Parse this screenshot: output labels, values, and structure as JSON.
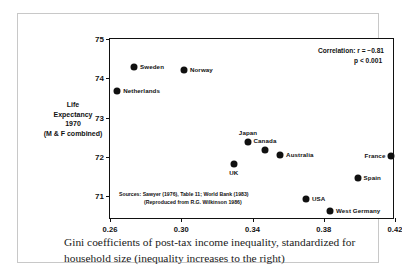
{
  "chart_data": {
    "type": "scatter",
    "title": "",
    "caption": "Gini coefficients of post-tax income inequality, standardized for household size (inequality increases to the right)",
    "xlabel": "",
    "ylabel": "Life Expectancy 1970 (M & F combined)",
    "ylabel_lines": [
      "Life",
      "Expectancy",
      "1970",
      "(M & F combined)"
    ],
    "xlim": [
      0.26,
      0.42
    ],
    "ylim": [
      70.4,
      75.0
    ],
    "xticks": [
      "0.26",
      "0.30",
      "0.34",
      "0.38",
      "0.42"
    ],
    "xtick_values": [
      0.26,
      0.3,
      0.34,
      0.38,
      0.42
    ],
    "yticks": [
      "71",
      "72",
      "73",
      "74",
      "75"
    ],
    "ytick_values": [
      71,
      72,
      73,
      74,
      75
    ],
    "grid": false,
    "legend": "none",
    "marker_color": "#101010",
    "axis_color": "#111111",
    "points": [
      {
        "label": "Sweden",
        "x": 0.2735,
        "y": 74.3,
        "label_pos": "right"
      },
      {
        "label": "Norway",
        "x": 0.3015,
        "y": 74.2,
        "label_pos": "right"
      },
      {
        "label": "Netherlands",
        "x": 0.264,
        "y": 73.68,
        "label_pos": "right"
      },
      {
        "label": "Japan",
        "x": 0.3375,
        "y": 72.38,
        "label_pos": "above"
      },
      {
        "label": "Canada",
        "x": 0.347,
        "y": 72.18,
        "label_pos": "above"
      },
      {
        "label": "Australia",
        "x": 0.3555,
        "y": 72.05,
        "label_pos": "right"
      },
      {
        "label": "France",
        "x": 0.418,
        "y": 72.03,
        "label_pos": "left"
      },
      {
        "label": "UK",
        "x": 0.3295,
        "y": 71.83,
        "label_pos": "below"
      },
      {
        "label": "Spain",
        "x": 0.399,
        "y": 71.47,
        "label_pos": "right"
      },
      {
        "label": "USA",
        "x": 0.37,
        "y": 70.93,
        "label_pos": "right"
      },
      {
        "label": "West Germany",
        "x": 0.3835,
        "y": 70.62,
        "label_pos": "right"
      }
    ],
    "annotations": {
      "correlation_line1": "Correlation:  r = −0.81",
      "correlation_line2": "p < 0.001",
      "sources_line1": "Sources:  Sawyer (1976), Table 11; World Bank (1983)",
      "sources_line2": "(Reproduced from R.G. Wilkinson 1986)"
    }
  }
}
